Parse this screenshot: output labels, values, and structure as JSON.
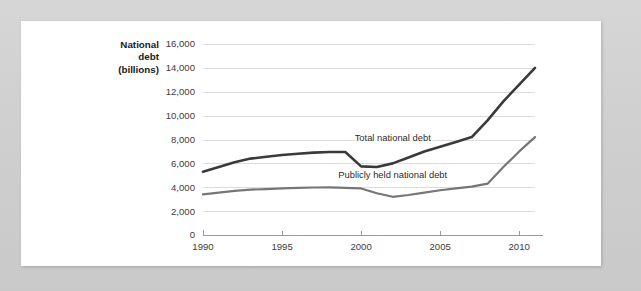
{
  "chart_data": {
    "type": "line",
    "title": "",
    "xlabel": "",
    "ylabel": "National debt (billions)",
    "ylabel_lines": [
      "National",
      "debt",
      "(billions)"
    ],
    "xlim": [
      1990,
      2011
    ],
    "ylim": [
      0,
      16000
    ],
    "grid": true,
    "legend_position": "inline-labels",
    "y_ticks": [
      0,
      2000,
      4000,
      6000,
      8000,
      10000,
      12000,
      14000,
      16000
    ],
    "y_tick_labels": [
      "0",
      "2,000",
      "4,000",
      "6,000",
      "8,000",
      "10,000",
      "12,000",
      "14,000",
      "16,000"
    ],
    "x_ticks": [
      1990,
      1995,
      2000,
      2005,
      2010
    ],
    "x_tick_labels": [
      "1990",
      "1995",
      "2000",
      "2005",
      "2010"
    ],
    "x": [
      1990,
      1991,
      1992,
      1993,
      1994,
      1995,
      1996,
      1997,
      1998,
      1999,
      2000,
      2001,
      2002,
      2003,
      2004,
      2005,
      2006,
      2007,
      2008,
      2009,
      2010,
      2011
    ],
    "series": [
      {
        "name": "Total national debt",
        "color": "#3a3a3a",
        "label_x": 2002,
        "label_y": 7900,
        "values": [
          5300,
          5700,
          6100,
          6400,
          6550,
          6700,
          6800,
          6900,
          6950,
          6950,
          5750,
          5700,
          6000,
          6500,
          7000,
          7400,
          7800,
          8200,
          9600,
          11200,
          12600,
          14000
        ]
      },
      {
        "name": "Publicly held national debt",
        "color": "#767676",
        "label_x": 2002,
        "label_y": 4800,
        "values": [
          3400,
          3550,
          3700,
          3800,
          3850,
          3900,
          3950,
          3980,
          3990,
          3950,
          3900,
          3500,
          3200,
          3350,
          3550,
          3750,
          3900,
          4050,
          4300,
          5700,
          7000,
          8200
        ]
      }
    ]
  },
  "layout": {
    "plot_left": 203,
    "plot_right": 535,
    "plot_top": 44,
    "plot_bottom": 235
  },
  "colors": {
    "background": "#d2d2d2",
    "card": "#ffffff",
    "grid": "#dcdcdc",
    "axis": "#9a9a9a",
    "tick_text": "#3b3b3b",
    "title_text": "#1a1a1a"
  }
}
